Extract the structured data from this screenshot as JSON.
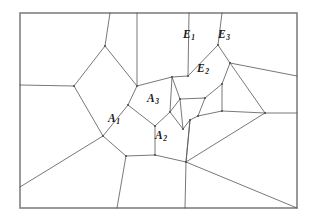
{
  "figure": {
    "kind": "voronoi-diagram",
    "title": "",
    "background_color": "#ffffff",
    "line_color": "#555555",
    "frame_color": "#808080",
    "label_color": "#1a1a1a",
    "line_width": 0.8,
    "frame_width": 1.6,
    "width": 315,
    "height": 221
  },
  "frame": {
    "x": 20,
    "y": 13,
    "width": 277,
    "height": 195
  },
  "labels": [
    {
      "id": "A1",
      "base": "A",
      "sub": "1",
      "text": "A₁",
      "x": 114,
      "y": 119
    },
    {
      "id": "A2",
      "base": "A",
      "sub": "2",
      "text": "A₂",
      "x": 161,
      "y": 136
    },
    {
      "id": "A3",
      "base": "A",
      "sub": "3",
      "text": "A₃",
      "x": 153,
      "y": 99
    },
    {
      "id": "E1",
      "base": "E",
      "sub": "1",
      "text": "E₁",
      "x": 189,
      "y": 35
    },
    {
      "id": "E2",
      "base": "E",
      "sub": "2",
      "text": "E₂",
      "x": 203,
      "y": 69
    },
    {
      "id": "E3",
      "base": "E",
      "sub": "3",
      "text": "E₃",
      "x": 224,
      "y": 35
    }
  ],
  "vertices": {
    "frame_tl": [
      20,
      13
    ],
    "frame_tr": [
      297,
      13
    ],
    "frame_br": [
      297,
      208
    ],
    "frame_bl": [
      20,
      208
    ],
    "top_a": [
      110,
      13
    ],
    "top_b": [
      137,
      13
    ],
    "top_c": [
      189,
      13
    ],
    "top_d": [
      222,
      13
    ],
    "left_a": [
      20,
      85
    ],
    "left_b": [
      20,
      187
    ],
    "right_a": [
      297,
      76
    ],
    "right_b": [
      297,
      113
    ],
    "bottom_a": [
      117,
      208
    ],
    "bottom_b": [
      185,
      208
    ],
    "v_n1": [
      105,
      46
    ],
    "v_n2": [
      74,
      86
    ],
    "v_n3": [
      137,
      86
    ],
    "v_n4": [
      128,
      105
    ],
    "v_n5": [
      103,
      136
    ],
    "v_n6": [
      126,
      156
    ],
    "v_n7": [
      155,
      155
    ],
    "v_n8": [
      155,
      126
    ],
    "v_n9": [
      172,
      77
    ],
    "v_n10": [
      188,
      76
    ],
    "v_n11": [
      218,
      45
    ],
    "v_n12": [
      230,
      63
    ],
    "v_n13": [
      222,
      84
    ],
    "v_n14": [
      205,
      98
    ],
    "v_n15": [
      180,
      99
    ],
    "v_n16": [
      170,
      112
    ],
    "v_n17": [
      198,
      116
    ],
    "v_n18": [
      183,
      129
    ],
    "v_n19": [
      186,
      162
    ],
    "v_n20": [
      222,
      111
    ],
    "v_n21": [
      265,
      113
    ],
    "v_n22": [
      190,
      120
    ]
  },
  "edges_count": 46,
  "cells": [
    {
      "name": "A1",
      "neighbors": [
        "A2",
        "A3"
      ]
    },
    {
      "name": "A2",
      "neighbors": [
        "A1",
        "A3"
      ]
    },
    {
      "name": "A3",
      "neighbors": [
        "A1",
        "A2",
        "E2"
      ]
    },
    {
      "name": "E1",
      "neighbors": [
        "E2",
        "E3"
      ]
    },
    {
      "name": "E2",
      "neighbors": [
        "E1",
        "E3",
        "A3"
      ]
    },
    {
      "name": "E3",
      "neighbors": [
        "E1",
        "E2"
      ]
    }
  ]
}
